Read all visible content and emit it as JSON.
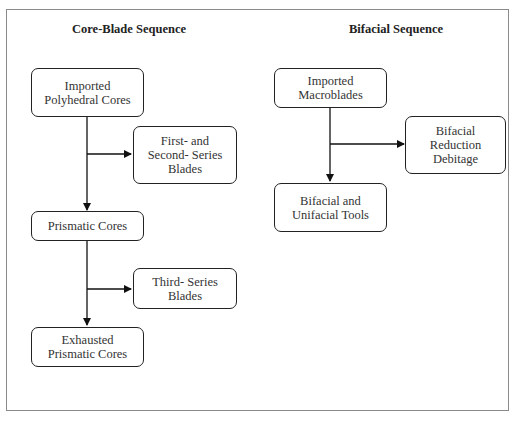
{
  "diagram": {
    "left_sequence": {
      "title": "Core-Blade Sequence",
      "nodes": [
        {
          "id": "imported-polyhedral-cores",
          "label": "Imported\nPolyhedral Cores"
        },
        {
          "id": "first-second-series-blades",
          "label": "First- and\nSecond- Series\nBlades"
        },
        {
          "id": "prismatic-cores",
          "label": "Prismatic Cores"
        },
        {
          "id": "third-series-blades",
          "label": "Third- Series\nBlades"
        },
        {
          "id": "exhausted-prismatic-cores",
          "label": "Exhausted\nPrismatic Cores"
        }
      ],
      "edges": [
        {
          "from": "imported-polyhedral-cores",
          "to": "prismatic-cores"
        },
        {
          "from": "imported-polyhedral-cores",
          "to": "first-second-series-blades"
        },
        {
          "from": "prismatic-cores",
          "to": "exhausted-prismatic-cores"
        },
        {
          "from": "prismatic-cores",
          "to": "third-series-blades"
        }
      ]
    },
    "right_sequence": {
      "title": "Bifacial Sequence",
      "nodes": [
        {
          "id": "imported-macroblades",
          "label": "Imported\nMacroblades"
        },
        {
          "id": "bifacial-reduction-debitage",
          "label": "Bifacial\nReduction\nDebitage"
        },
        {
          "id": "bifacial-unifacial-tools",
          "label": "Bifacial and\nUnifacial Tools"
        }
      ],
      "edges": [
        {
          "from": "imported-macroblades",
          "to": "bifacial-unifacial-tools"
        },
        {
          "from": "imported-macroblades",
          "to": "bifacial-reduction-debitage"
        }
      ]
    }
  }
}
